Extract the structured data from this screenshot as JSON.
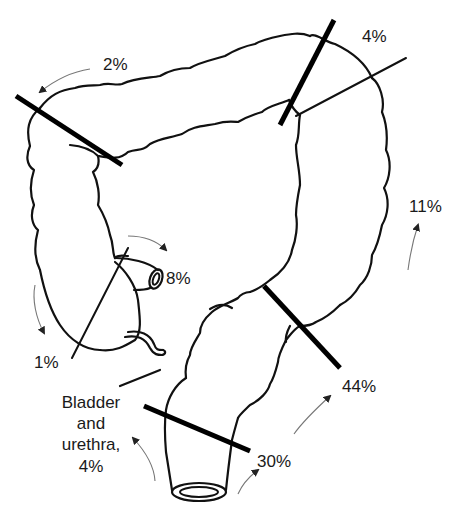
{
  "diagram": {
    "labels": {
      "transverse_left": "2%",
      "splenic_flexure": "4%",
      "descending": "11%",
      "appendix": "8%",
      "cecum": "1%",
      "sigmoid": "44%",
      "rectum": "30%",
      "bladder_line1": "Bladder",
      "bladder_line2": "and",
      "bladder_line3": "urethra,",
      "bladder_line4": "4%"
    },
    "colors": {
      "line": "#111111",
      "bar": "#000000",
      "arrow": "#777777",
      "background": "#ffffff"
    }
  }
}
